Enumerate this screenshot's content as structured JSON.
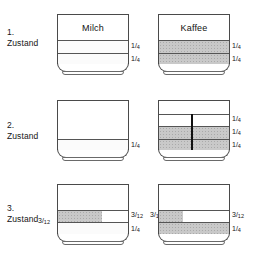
{
  "figure": {
    "title_caption_left": "Milch",
    "title_caption_right": "Kaffee",
    "colors": {
      "outline": "#4a4a4a",
      "coffee_fill": "#c9c9c9",
      "milk_fill": "#fbfbfb",
      "empty_fill": "#ffffff",
      "divider": "#101010"
    },
    "rows": [
      {
        "state_number": "1.",
        "state_word": "Zustand",
        "left_glass": {
          "label": "Milch",
          "annotations": [
            {
              "text": "1/4",
              "numerator": "1",
              "denominator": "4"
            },
            {
              "text": "1/4",
              "numerator": "1",
              "denominator": "4"
            }
          ]
        },
        "right_glass": {
          "label": "Kaffee",
          "annotations": [
            {
              "text": "1/4",
              "numerator": "1",
              "denominator": "4"
            },
            {
              "text": "1/4",
              "numerator": "1",
              "denominator": "4"
            }
          ]
        }
      },
      {
        "state_number": "2.",
        "state_word": "Zustand",
        "left_glass": {
          "label": "",
          "annotations": [
            {
              "text": "1/4",
              "numerator": "1",
              "denominator": "4"
            }
          ]
        },
        "right_glass": {
          "label": "",
          "annotations": [
            {
              "text": "1/4",
              "numerator": "1",
              "denominator": "4"
            },
            {
              "text": "1/4",
              "numerator": "1",
              "denominator": "4"
            },
            {
              "text": "1/4",
              "numerator": "1",
              "denominator": "4"
            }
          ]
        }
      },
      {
        "state_number": "3.",
        "state_word": "Zustand",
        "left_glass": {
          "label": "",
          "annotations": [
            {
              "text": "3/12",
              "numerator": "3",
              "denominator": "12"
            },
            {
              "text": "3/12",
              "numerator": "3",
              "denominator": "12"
            },
            {
              "text": "1/4",
              "numerator": "1",
              "denominator": "4"
            }
          ]
        },
        "right_glass": {
          "label": "",
          "annotations": [
            {
              "text": "3/12",
              "numerator": "3",
              "denominator": "12"
            },
            {
              "text": "3/12",
              "numerator": "3",
              "denominator": "12"
            },
            {
              "text": "1/4",
              "numerator": "1",
              "denominator": "4"
            }
          ]
        }
      }
    ]
  }
}
